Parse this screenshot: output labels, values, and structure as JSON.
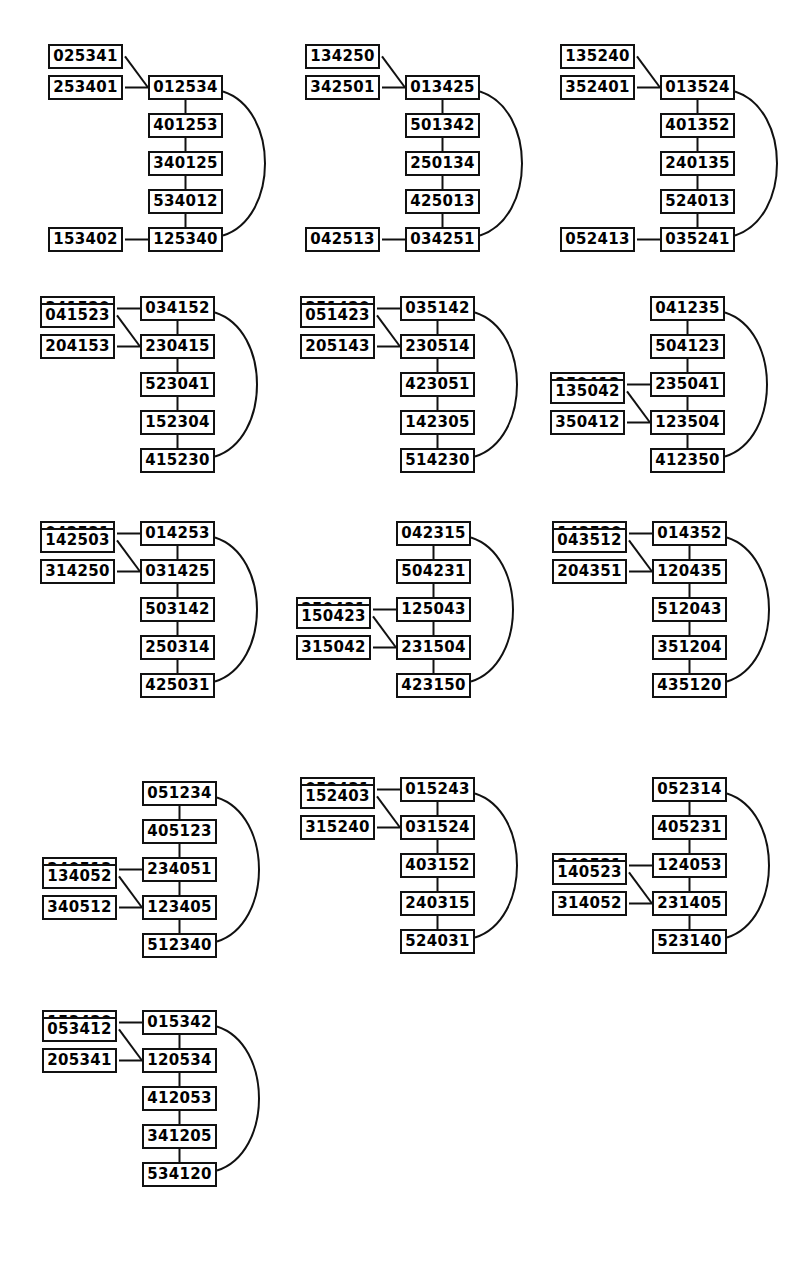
{
  "page": {
    "background": "#ffffff",
    "ink": "#111111",
    "width": 809,
    "height": 1270,
    "figure_type": "permutation-graph-collection"
  },
  "diagrams": [
    {
      "id": "diagram-1",
      "chain": [
        "012534",
        "401253",
        "340125",
        "534012",
        "125340"
      ],
      "leaves": [
        {
          "label": "025341",
          "attach": 0
        },
        {
          "label": "253401",
          "attach": 0
        },
        {
          "label": "153402",
          "attach": 4
        }
      ]
    },
    {
      "id": "diagram-2",
      "chain": [
        "013425",
        "501342",
        "250134",
        "425013",
        "034251"
      ],
      "leaves": [
        {
          "label": "134250",
          "attach": 0
        },
        {
          "label": "342501",
          "attach": 0
        },
        {
          "label": "042513",
          "attach": 4
        }
      ]
    },
    {
      "id": "diagram-3",
      "chain": [
        "013524",
        "401352",
        "240135",
        "524013",
        "035241"
      ],
      "leaves": [
        {
          "label": "135240",
          "attach": 0
        },
        {
          "label": "352401",
          "attach": 0
        },
        {
          "label": "052413",
          "attach": 4
        }
      ]
    },
    {
      "id": "diagram-4",
      "chain": [
        "034152",
        "230415",
        "523041",
        "152304",
        "415230"
      ],
      "leaves": [
        {
          "label": "341520",
          "attach": 0
        },
        {
          "label": "041523",
          "attach": 1
        },
        {
          "label": "204153",
          "attach": 1
        }
      ]
    },
    {
      "id": "diagram-5",
      "chain": [
        "035142",
        "230514",
        "423051",
        "142305",
        "514230"
      ],
      "leaves": [
        {
          "label": "351420",
          "attach": 0
        },
        {
          "label": "051423",
          "attach": 1
        },
        {
          "label": "205143",
          "attach": 1
        }
      ]
    },
    {
      "id": "diagram-6",
      "chain": [
        "041235",
        "504123",
        "235041",
        "123504",
        "412350"
      ],
      "leaves": [
        {
          "label": "250413",
          "attach": 2
        },
        {
          "label": "135042",
          "attach": 3
        },
        {
          "label": "350412",
          "attach": 3
        }
      ]
    },
    {
      "id": "diagram-7",
      "chain": [
        "014253",
        "031425",
        "503142",
        "250314",
        "425031"
      ],
      "leaves": [
        {
          "label": "042531",
          "attach": 0
        },
        {
          "label": "142503",
          "attach": 1
        },
        {
          "label": "314250",
          "attach": 1
        }
      ]
    },
    {
      "id": "diagram-8",
      "chain": [
        "042315",
        "504231",
        "125043",
        "231504",
        "423150"
      ],
      "leaves": [
        {
          "label": "250431",
          "attach": 2
        },
        {
          "label": "150423",
          "attach": 3
        },
        {
          "label": "315042",
          "attach": 3
        }
      ]
    },
    {
      "id": "diagram-9",
      "chain": [
        "014352",
        "120435",
        "512043",
        "351204",
        "435120"
      ],
      "leaves": [
        {
          "label": "143520",
          "attach": 0
        },
        {
          "label": "043512",
          "attach": 1
        },
        {
          "label": "204351",
          "attach": 1
        }
      ]
    },
    {
      "id": "diagram-10",
      "chain": [
        "051234",
        "405123",
        "234051",
        "123405",
        "512340"
      ],
      "leaves": [
        {
          "label": "240513",
          "attach": 2
        },
        {
          "label": "134052",
          "attach": 3
        },
        {
          "label": "340512",
          "attach": 3
        }
      ]
    },
    {
      "id": "diagram-11",
      "chain": [
        "015243",
        "031524",
        "403152",
        "240315",
        "524031"
      ],
      "leaves": [
        {
          "label": "052431",
          "attach": 0
        },
        {
          "label": "152403",
          "attach": 1
        },
        {
          "label": "315240",
          "attach": 1
        }
      ]
    },
    {
      "id": "diagram-12",
      "chain": [
        "052314",
        "405231",
        "124053",
        "231405",
        "523140"
      ],
      "leaves": [
        {
          "label": "240531",
          "attach": 2
        },
        {
          "label": "140523",
          "attach": 3
        },
        {
          "label": "314052",
          "attach": 3
        }
      ]
    },
    {
      "id": "diagram-13",
      "chain": [
        "015342",
        "120534",
        "412053",
        "341205",
        "534120"
      ],
      "leaves": [
        {
          "label": "153420",
          "attach": 0
        },
        {
          "label": "053412",
          "attach": 1
        },
        {
          "label": "205341",
          "attach": 1
        }
      ]
    }
  ],
  "layout": {
    "origins": [
      {
        "id": "diagram-1",
        "x": 48,
        "y": 75
      },
      {
        "id": "diagram-2",
        "x": 305,
        "y": 75
      },
      {
        "id": "diagram-3",
        "x": 560,
        "y": 75
      },
      {
        "id": "diagram-4",
        "x": 40,
        "y": 296
      },
      {
        "id": "diagram-5",
        "x": 300,
        "y": 296
      },
      {
        "id": "diagram-6",
        "x": 550,
        "y": 296
      },
      {
        "id": "diagram-7",
        "x": 40,
        "y": 521
      },
      {
        "id": "diagram-8",
        "x": 296,
        "y": 521
      },
      {
        "id": "diagram-9",
        "x": 552,
        "y": 521
      },
      {
        "id": "diagram-10",
        "x": 42,
        "y": 781
      },
      {
        "id": "diagram-11",
        "x": 300,
        "y": 777
      },
      {
        "id": "diagram-12",
        "x": 552,
        "y": 777
      },
      {
        "id": "diagram-13",
        "x": 42,
        "y": 1010
      }
    ],
    "chain_x_offset": 100,
    "leaf_x_offset": 0,
    "row_step": 38,
    "node_width": 75,
    "node_height": 25
  }
}
